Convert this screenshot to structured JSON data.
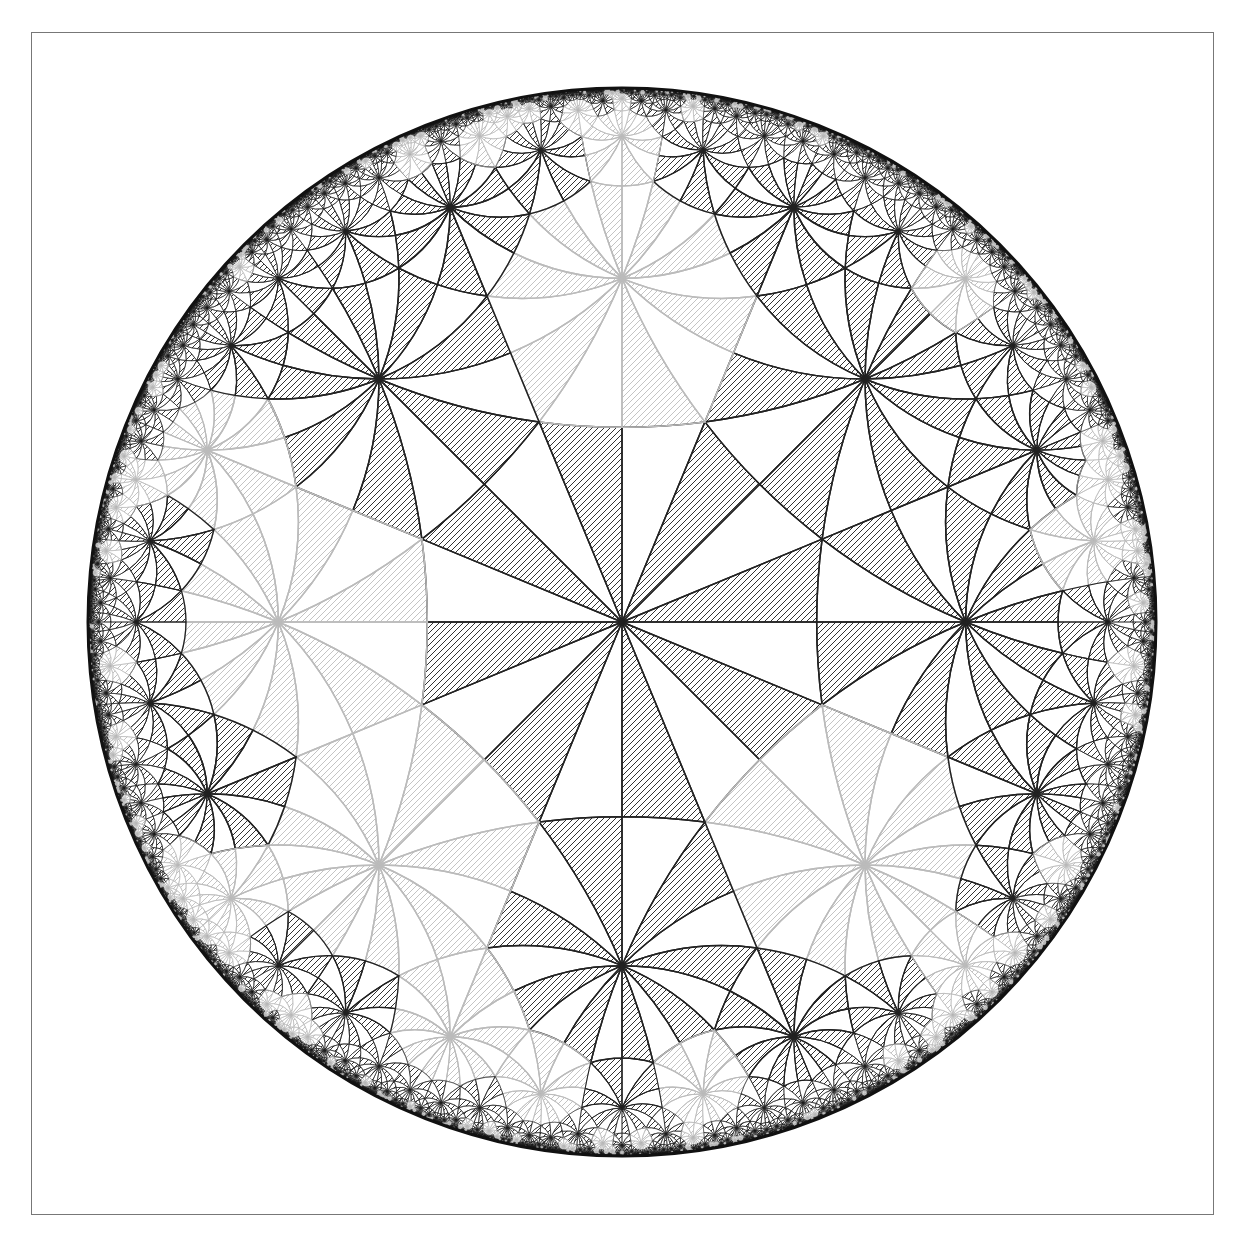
{
  "figure": {
    "type": "hyperbolic-triangle-tiling",
    "model": "Poincare disk",
    "triangle_group": [
      2,
      3,
      8
    ],
    "frame": {
      "x": 31,
      "y": 32,
      "width": 1183,
      "height": 1183,
      "border_color": "#777777"
    },
    "disk": {
      "cx": 622,
      "cy": 622,
      "radius": 534,
      "boundary_color": "#111111"
    },
    "colors": {
      "edge_dark": "#222222",
      "edge_light": "#bbbbbb",
      "hatch_dark": "#333333",
      "hatch_light": "#c4c4c4",
      "background": "#ffffff"
    },
    "hatch": {
      "spacing_px": 6,
      "angle_deg": 45
    },
    "max_depth": 28
  }
}
